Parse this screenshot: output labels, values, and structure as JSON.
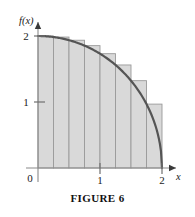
{
  "figure": {
    "caption": "FIGURE 6",
    "background_color": "#ffffff"
  },
  "axes": {
    "y_axis_label": "f(x)",
    "x_axis_label": "x",
    "origin_label": "0",
    "y_ticks": [
      {
        "value": 1,
        "label": "1"
      },
      {
        "value": 2,
        "label": "2"
      }
    ],
    "x_ticks": [
      {
        "value": 1,
        "label": "1"
      },
      {
        "value": 2,
        "label": "2"
      }
    ]
  },
  "chart_data": {
    "type": "area",
    "title": "FIGURE 6",
    "xlabel": "x",
    "ylabel": "f(x)",
    "xlim": [
      0,
      2
    ],
    "ylim": [
      0,
      2
    ],
    "grid": false,
    "legend": "none",
    "curve": {
      "name": "f(x) = sqrt(4 - x^2)",
      "description": "quarter circle of radius 2 from (0,2) to (2,0)",
      "color": "#555555",
      "x": [
        0,
        0.25,
        0.5,
        0.75,
        1,
        1.25,
        1.5,
        1.75,
        2
      ],
      "y": [
        2,
        1.984,
        1.936,
        1.854,
        1.732,
        1.561,
        1.323,
        0.968,
        0
      ]
    },
    "riemann_rectangles": {
      "method": "left endpoint",
      "count": 8,
      "width": 0.25,
      "fill_color": "#d9d9d9",
      "edge_color": "#9a9a9a",
      "left_edges": [
        0,
        0.25,
        0.5,
        0.75,
        1,
        1.25,
        1.5,
        1.75
      ],
      "heights": [
        2,
        1.984,
        1.936,
        1.854,
        1.732,
        1.561,
        1.323,
        0.968
      ]
    }
  }
}
